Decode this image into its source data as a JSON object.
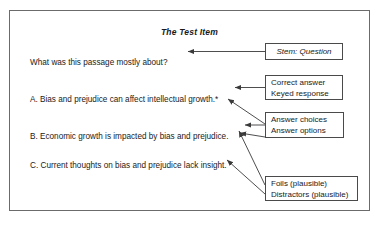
{
  "figure": {
    "title": "The Test Item",
    "item": {
      "stem": "What was this passage mostly about?",
      "options": [
        {
          "id": "A",
          "text": "A. Bias and prejudice can affect intellectual growth.*"
        },
        {
          "id": "B",
          "text": "B. Economic growth is impacted by bias and prejudice."
        },
        {
          "id": "C",
          "text": "C. Current thoughts on bias and prejudice lack insight."
        }
      ]
    },
    "callouts": {
      "stem": {
        "line1": "Stem: Question"
      },
      "correct": {
        "line1": "Correct answer",
        "line2": "Keyed response"
      },
      "choices": {
        "line1": "Answer choices",
        "line2": "Answer options"
      },
      "foils": {
        "line1": "Foils (plausible)",
        "line2": "Distractors (plausible)"
      }
    },
    "colors": {
      "frame_border": "#6b6b6b",
      "callout_border": "#4a4a4a",
      "connector": "#3a3a3a",
      "text": "#1a1a1a",
      "background": "#ffffff"
    }
  }
}
